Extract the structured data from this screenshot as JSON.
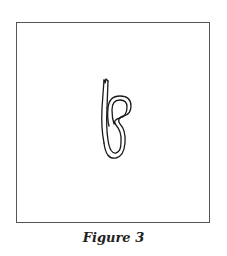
{
  "figure": {
    "caption": "Figure 3"
  }
}
